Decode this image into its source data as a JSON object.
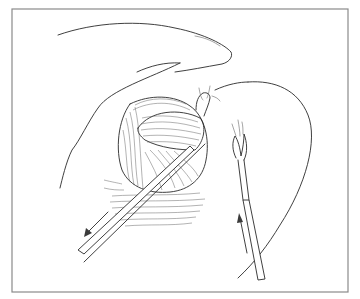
{
  "figure": {
    "type": "surgical-line-illustration",
    "frame": {
      "x": 12,
      "y": 9,
      "width": 336,
      "height": 283,
      "stroke": "#8a8a8a"
    },
    "ink_color": "#2a2a2a",
    "background": "#ffffff",
    "elements": {
      "skin_flap": "upper retracted skin flap",
      "tissue_mass": "fibrous muscle bundle with hatching",
      "left_instrument": "retractor rod exiting lower-left",
      "left_arrow": "arrow pointing down-left (withdrawal direction)",
      "right_instrument": "electrocautery / forceps probe",
      "right_arrow": "arrow pointing up (insertion direction)"
    }
  }
}
